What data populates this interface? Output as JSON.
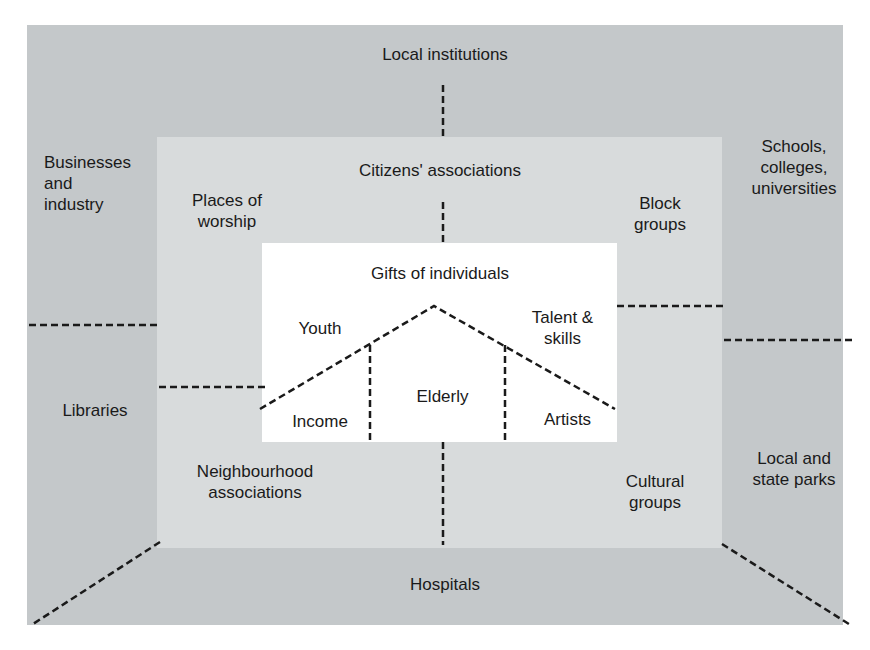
{
  "diagram": {
    "outer_ring": {
      "top": "Local institutions",
      "left_top": [
        "Businesses",
        "and",
        "industry"
      ],
      "left_bottom": "Libraries",
      "right_top": [
        "Schools,",
        "colleges,",
        "universities"
      ],
      "right_bottom": [
        "Local and",
        "state parks"
      ],
      "bottom": "Hospitals"
    },
    "middle_ring": {
      "top": "Citizens' associations",
      "left_top": [
        "Places of",
        "worship"
      ],
      "right_top": [
        "Block",
        "groups"
      ],
      "left_bottom": [
        "Neighbourhood",
        "associations"
      ],
      "right_bottom": [
        "Cultural",
        "groups"
      ]
    },
    "core": {
      "title": "Gifts of individuals",
      "left_upper": "Youth",
      "right_upper": [
        "Talent &",
        "skills"
      ],
      "left_lower": "Income",
      "center_lower": "Elderly",
      "right_lower": "Artists"
    },
    "colors": {
      "outer": "#c4c8ca",
      "middle": "#d8dbdc",
      "inner": "#ffffff",
      "line": "#1a1a1a"
    }
  }
}
